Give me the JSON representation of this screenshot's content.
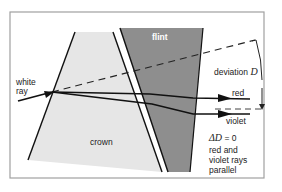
{
  "diagram": {
    "labels": {
      "white_ray": [
        "white",
        "ray"
      ],
      "flint": "flint",
      "crown": "crown",
      "deviation": "deviation",
      "deviation_symbol": "D",
      "red": "red",
      "violet": "violet",
      "delta_d_symbol": "ΔD",
      "delta_d_value": "= 0",
      "conclusion": [
        "red and",
        "violet rays",
        "parallel"
      ]
    },
    "colors": {
      "crown_fill": "#e4e4e4",
      "flint_fill": "#8f8f8f",
      "ray": "#111111",
      "frame": "#9a9a9a"
    }
  }
}
